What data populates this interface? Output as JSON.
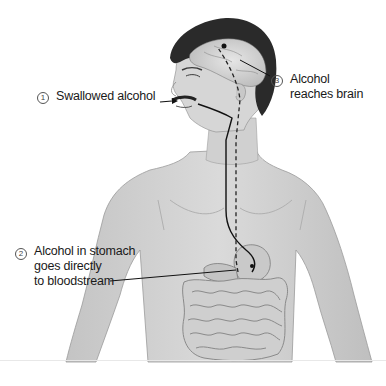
{
  "diagram": {
    "type": "anatomical-illustration",
    "colors": {
      "skin": "#d4d4d4",
      "skin_shadow": "#b8b8b8",
      "hair": "#2a2a2a",
      "line": "#111111",
      "text": "#1a1a1a"
    },
    "steps": [
      {
        "number": "1",
        "label_lines": [
          "Swallowed alcohol"
        ]
      },
      {
        "number": "2",
        "label_lines": [
          "Alcohol in stomach",
          "goes directly",
          "to bloodstream"
        ]
      },
      {
        "number": "3",
        "label_lines": [
          "Alcohol",
          "reaches brain"
        ]
      }
    ]
  }
}
